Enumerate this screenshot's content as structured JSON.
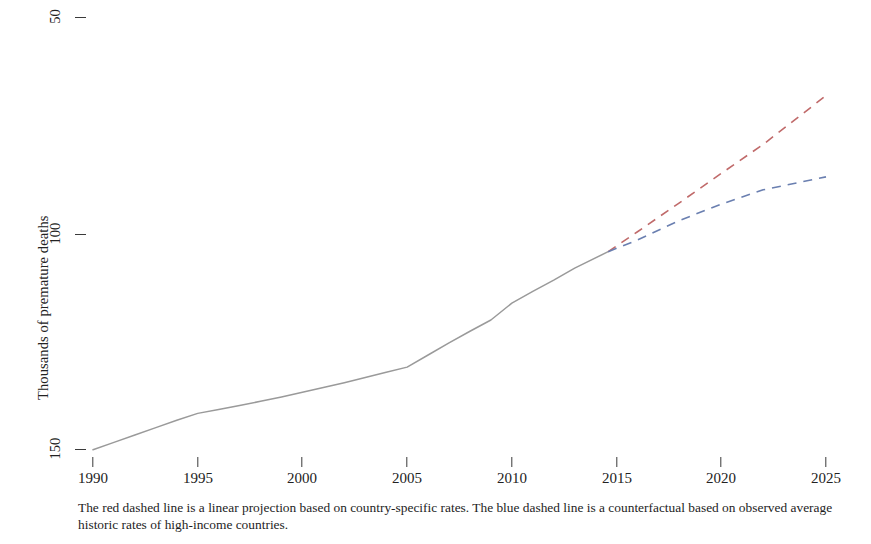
{
  "figure": {
    "caption": "The red dashed line is a linear projection based on country-specific rates. The blue dashed line is a counterfactual based on observed average historic rates of high-income countries.",
    "background_color": "#ffffff",
    "text_color": "#1d1d1d"
  },
  "chart_data": {
    "type": "line",
    "title": "",
    "xlabel": "",
    "ylabel": "Thousands of premature deaths",
    "xlim": [
      1989,
      2026
    ],
    "ylim": [
      47,
      152
    ],
    "xticks": [
      1990,
      1995,
      2000,
      2005,
      2010,
      2015,
      2020,
      2025
    ],
    "xtick_labels": [
      "1990",
      "1995",
      "2000",
      "2005",
      "2010",
      "2015",
      "2020",
      "2025"
    ],
    "yticks": [
      50,
      100,
      150
    ],
    "ytick_labels": [
      "50",
      "100",
      "150"
    ],
    "grid": false,
    "legend": "none",
    "series": [
      {
        "name": "Observed",
        "style": "solid",
        "color": "#9a9a9a",
        "x": [
          1990,
          1991,
          1992,
          1993,
          1994,
          1995,
          1996,
          1997,
          1998,
          1999,
          2000,
          2001,
          2002,
          2003,
          2004,
          2005,
          2006,
          2007,
          2008,
          2009,
          2010,
          2011,
          2012,
          2013,
          2014.6
        ],
        "values": [
          50.0,
          51.7,
          53.4,
          55.1,
          56.8,
          58.4,
          59.3,
          60.2,
          61.2,
          62.2,
          63.3,
          64.4,
          65.5,
          66.7,
          67.9,
          69.1,
          71.9,
          74.7,
          77.4,
          80.0,
          83.9,
          86.6,
          89.2,
          92.0,
          95.8
        ]
      },
      {
        "name": "Linear projection based on country-specific rates",
        "style": "dashed",
        "color": "#c06a6a",
        "x": [
          2014.6,
          2016,
          2018,
          2020,
          2022,
          2025
        ],
        "values": [
          95.8,
          100.4,
          107.1,
          113.9,
          120.6,
          131.9
        ]
      },
      {
        "name": "Counterfactual based on observed average historic rates of high-income countries",
        "style": "dashed",
        "color": "#6a7fb0",
        "x": [
          2014.6,
          2016,
          2018,
          2020,
          2022,
          2025
        ],
        "values": [
          95.8,
          98.5,
          103.0,
          106.8,
          110.1,
          113.1
        ]
      }
    ]
  }
}
